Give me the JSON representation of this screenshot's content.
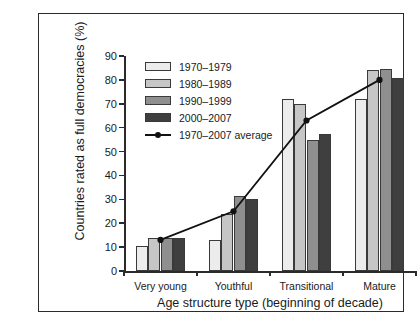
{
  "chart_data": {
    "type": "bar",
    "title": "",
    "xlabel": "Age structure type (beginning of decade)",
    "ylabel": "Countries rated as full democracies (%)",
    "categories": [
      "Very young",
      "Youthful",
      "Transitional",
      "Mature"
    ],
    "ylim": [
      0,
      90
    ],
    "yticks": [
      0,
      10,
      20,
      30,
      40,
      50,
      60,
      70,
      80,
      90
    ],
    "ytick_labels": [
      "0",
      "10",
      "20",
      "30",
      "40",
      "50",
      "60",
      "70",
      "80",
      "90"
    ],
    "grid": false,
    "legend_position": "upper-left inside",
    "series": [
      {
        "name": "1970–1979",
        "type": "bar",
        "color": "#ececec",
        "values": [
          10.5,
          13.0,
          72.0,
          72.0
        ]
      },
      {
        "name": "1980–1989",
        "type": "bar",
        "color": "#c6c6c6",
        "values": [
          14.0,
          24.0,
          70.0,
          84.0
        ]
      },
      {
        "name": "1990–1999",
        "type": "bar",
        "color": "#8f8f8f",
        "values": [
          14.0,
          31.5,
          55.0,
          84.5
        ]
      },
      {
        "name": "2000–2007",
        "type": "bar",
        "color": "#3f3f3f",
        "values": [
          14.0,
          30.0,
          57.5,
          81.0
        ]
      },
      {
        "name": "1970–2007 average",
        "type": "line",
        "color": "#111111",
        "values": [
          13.0,
          25.0,
          63.0,
          80.0
        ]
      }
    ]
  },
  "legend": {
    "items": [
      {
        "label": "1970–1979",
        "swatch": "#ececec",
        "kind": "swatch"
      },
      {
        "label": "1980–1989",
        "swatch": "#c6c6c6",
        "kind": "swatch"
      },
      {
        "label": "1990–1999",
        "swatch": "#8f8f8f",
        "kind": "swatch"
      },
      {
        "label": "2000–2007",
        "swatch": "#3f3f3f",
        "kind": "swatch"
      },
      {
        "label": "1970–2007 average",
        "swatch": "#111111",
        "kind": "line"
      }
    ]
  }
}
